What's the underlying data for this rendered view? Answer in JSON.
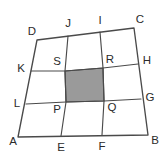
{
  "figure": {
    "canvas": {
      "width": 166,
      "height": 160,
      "background": "#ffffff"
    },
    "style": {
      "line_color": "#4a4a4a",
      "label_color": "#2b2b2b",
      "shade_fill": "#9a9a9a",
      "shade_stroke": "#4a4a4a"
    },
    "outer_quad": {
      "name": "ABCD",
      "path": "M 18 137 L 148 135 L 134 28 L 37 40 Z"
    },
    "grid_paths": {
      "vertical_left": "M 61 136 L 66 102 L 65 71 L 68 36",
      "vertical_right": "M 102 135 L 104 101 L 103 68 L 100 32",
      "horizontal_upper": "M 31 71 L 65 71 L 103 68 L 138 64",
      "horizontal_lower": "M 26 104 L 66 102 L 104 101 L 141 99"
    },
    "shaded_cell": {
      "name": "SRQP",
      "path": "M 65 71 L 103 68 L 104 101 L 66 102 Z",
      "fill": "#9a9a9a"
    },
    "labels": [
      {
        "id": "A",
        "text": "A",
        "x": 13,
        "y": 142,
        "role": "outer-corner"
      },
      {
        "id": "B",
        "text": "B",
        "x": 155,
        "y": 141,
        "role": "outer-corner"
      },
      {
        "id": "C",
        "text": "C",
        "x": 140,
        "y": 20,
        "role": "outer-corner"
      },
      {
        "id": "D",
        "text": "D",
        "x": 32,
        "y": 32,
        "role": "outer-corner"
      },
      {
        "id": "E",
        "text": "E",
        "x": 61,
        "y": 148,
        "role": "edge-point"
      },
      {
        "id": "F",
        "text": "F",
        "x": 102,
        "y": 147,
        "role": "edge-point"
      },
      {
        "id": "G",
        "text": "G",
        "x": 150,
        "y": 98,
        "role": "edge-point"
      },
      {
        "id": "H",
        "text": "H",
        "x": 147,
        "y": 61,
        "role": "edge-point"
      },
      {
        "id": "I",
        "text": "I",
        "x": 100,
        "y": 21,
        "role": "edge-point"
      },
      {
        "id": "J",
        "text": "J",
        "x": 68,
        "y": 24,
        "role": "edge-point"
      },
      {
        "id": "K",
        "text": "K",
        "x": 21,
        "y": 69,
        "role": "edge-point"
      },
      {
        "id": "L",
        "text": "L",
        "x": 17,
        "y": 104,
        "role": "edge-point"
      },
      {
        "id": "P",
        "text": "P",
        "x": 57,
        "y": 110,
        "role": "interior-point"
      },
      {
        "id": "Q",
        "text": "Q",
        "x": 112,
        "y": 108,
        "role": "interior-point"
      },
      {
        "id": "R",
        "text": "R",
        "x": 110,
        "y": 60,
        "role": "interior-point"
      },
      {
        "id": "S",
        "text": "S",
        "x": 57,
        "y": 62,
        "role": "interior-point"
      }
    ]
  }
}
